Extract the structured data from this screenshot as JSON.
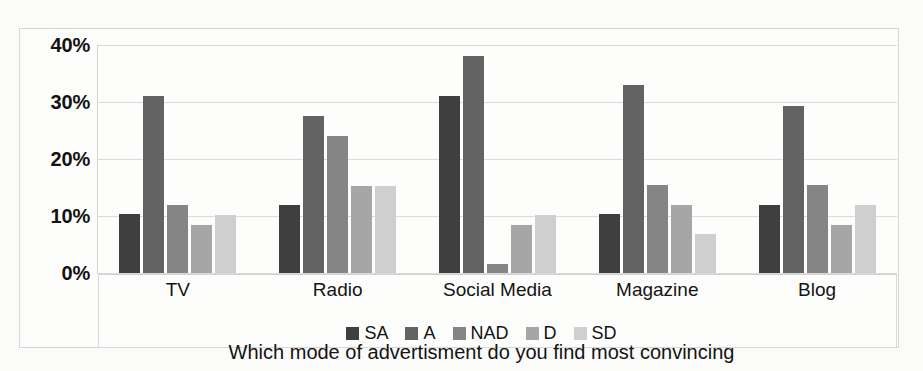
{
  "chart_data": {
    "type": "bar",
    "title": "",
    "subtitle": "",
    "xlabel": "Which mode of advertisment do you find most convincing",
    "ylabel": "",
    "categories": [
      "TV",
      "Radio",
      "Social Media",
      "Magazine",
      "Blog"
    ],
    "ylim": [
      0,
      40
    ],
    "ytick_labels": [
      "0%",
      "10%",
      "20%",
      "30%",
      "40%"
    ],
    "ytick_values": [
      0,
      10,
      20,
      30,
      40
    ],
    "grid": true,
    "legend_position": "bottom",
    "series": [
      {
        "name": "SA",
        "color": "#3f3f3f",
        "values": [
          10.3,
          12.0,
          31.0,
          10.3,
          12.0
        ]
      },
      {
        "name": "A",
        "color": "#636363",
        "values": [
          31.0,
          27.5,
          38.0,
          33.0,
          29.3
        ]
      },
      {
        "name": "NAD",
        "color": "#858585",
        "values": [
          12.0,
          24.0,
          1.5,
          15.5,
          15.5
        ]
      },
      {
        "name": "D",
        "color": "#a6a6a6",
        "values": [
          8.5,
          15.3,
          8.5,
          12.0,
          8.5
        ]
      },
      {
        "name": "SD",
        "color": "#cfcfcf",
        "values": [
          10.2,
          15.3,
          10.2,
          6.8,
          12.0
        ]
      }
    ]
  }
}
